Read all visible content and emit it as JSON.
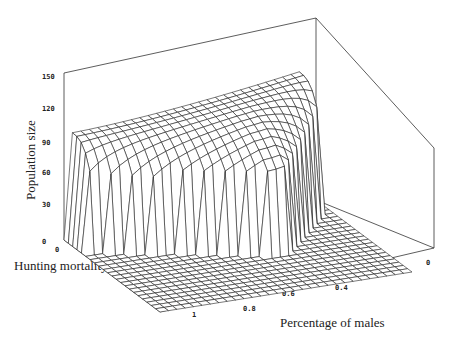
{
  "chart_data": {
    "type": "surface3d",
    "title": "",
    "zlabel": "Population size",
    "xlabel": "Percentage of males",
    "ylabel": "Hunting mortality",
    "zlim": [
      0,
      150
    ],
    "z_ticks": [
      "0",
      "30",
      "60",
      "90",
      "120",
      "150"
    ],
    "x_ticks": [
      "1",
      "0.8",
      "0.6",
      "0.4",
      "0.2",
      "0"
    ],
    "y_ticks": [
      "0",
      "0.1",
      "0.2",
      "0.3",
      "0.4"
    ],
    "xlim": [
      0,
      1
    ],
    "ylim": [
      0,
      0.4
    ],
    "grid": false,
    "legend": null,
    "plateau_level_low_mortality": 95,
    "max_level": 120,
    "collapsed_level": 0
  },
  "labels": {
    "z_axis": "Population size",
    "x_axis": "Percentage of males",
    "y_axis": "Hunting mortality"
  }
}
